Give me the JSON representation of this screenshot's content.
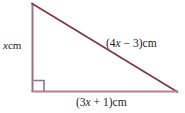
{
  "figure": {
    "background_color": "#ffffff",
    "width": 185,
    "height": 113
  },
  "colors": {
    "vertical_leg": "#9a6f86",
    "hypotenuse": "#7d3a4a",
    "base_leg": "#b5808f",
    "right_angle_marker": "#9a6f86",
    "text": "#1a1a1a"
  },
  "geometry": {
    "apex": {
      "x": 32,
      "y": 3
    },
    "bottom_left": {
      "x": 32,
      "y": 92
    },
    "bottom_right": {
      "x": 177,
      "y": 92
    },
    "right_angle_marker": {
      "x": 33,
      "y": 80,
      "size": 11
    }
  },
  "labels": {
    "vertical": {
      "variable": "x",
      "unit": "cm",
      "full_text": "x cm"
    },
    "hypotenuse": {
      "open_paren": "(",
      "coefficient": "4",
      "variable": "x",
      "operator": " − ",
      "constant": "3",
      "close_paren": ")",
      "unit": "cm",
      "full_text": "(4x − 3)cm"
    },
    "base": {
      "open_paren": "(",
      "coefficient": "3",
      "variable": "x",
      "operator": " + ",
      "constant": "1",
      "close_paren": ")",
      "unit": "cm",
      "full_text": "(3x + 1)cm"
    }
  }
}
